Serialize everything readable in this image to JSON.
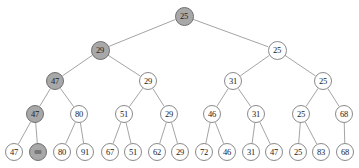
{
  "figure": {
    "name": "binary-tournament-tree",
    "background_color": "#ffffff",
    "node_fill_default": "#ffffff",
    "node_fill_highlight": "#a8a8a8",
    "node_stroke": "#8a8a8a",
    "edge_color": "#9a9a9a",
    "text_color": "#1a1a1a"
  },
  "nodes": [
    {
      "id": "n0",
      "label": "25",
      "level": 0,
      "x": 184,
      "y": 16,
      "r": 9.5,
      "highlighted": true,
      "legible": true
    },
    {
      "id": "n1",
      "label": "29",
      "level": 1,
      "x": 100,
      "y": 50,
      "r": 9.5,
      "highlighted": true,
      "legible": true
    },
    {
      "id": "n2",
      "label": "25",
      "level": 1,
      "x": 277,
      "y": 50,
      "r": 9.5,
      "highlighted": false,
      "legible": true
    },
    {
      "id": "n3",
      "label": "47",
      "level": 2,
      "x": 55,
      "y": 81,
      "r": 9,
      "highlighted": true,
      "legible": true
    },
    {
      "id": "n4",
      "label": "29",
      "level": 2,
      "x": 148,
      "y": 81,
      "r": 9,
      "highlighted": false,
      "legible": true
    },
    {
      "id": "n5",
      "label": "31",
      "level": 2,
      "x": 233,
      "y": 81,
      "r": 9,
      "highlighted": false,
      "legible": true
    },
    {
      "id": "n6",
      "label": "25",
      "level": 2,
      "x": 323,
      "y": 81,
      "r": 9,
      "highlighted": false,
      "legible": true
    },
    {
      "id": "n7",
      "label": "47",
      "level": 3,
      "x": 35,
      "y": 114,
      "r": 9,
      "highlighted": true,
      "legible": true
    },
    {
      "id": "n8",
      "label": "80",
      "level": 3,
      "x": 79,
      "y": 114,
      "r": 9,
      "highlighted": false,
      "legible": true
    },
    {
      "id": "n9",
      "label": "51",
      "level": 3,
      "x": 124,
      "y": 114,
      "r": 9,
      "highlighted": false,
      "legible": true
    },
    {
      "id": "n10",
      "label": "29",
      "level": 3,
      "x": 169,
      "y": 114,
      "r": 9,
      "highlighted": false,
      "legible": true
    },
    {
      "id": "n11",
      "label": "46",
      "level": 3,
      "x": 212,
      "y": 114,
      "r": 9,
      "highlighted": false,
      "legible": true
    },
    {
      "id": "n12",
      "label": "31",
      "level": 3,
      "x": 256,
      "y": 114,
      "r": 9,
      "highlighted": false,
      "legible": true
    },
    {
      "id": "n13",
      "label": "25",
      "level": 3,
      "x": 301,
      "y": 114,
      "r": 9,
      "highlighted": false,
      "legible": true
    },
    {
      "id": "n14",
      "label": "68",
      "level": 3,
      "x": 344,
      "y": 114,
      "r": 9,
      "highlighted": false,
      "legible": true
    },
    {
      "id": "n15",
      "label": "47",
      "level": 4,
      "x": 14,
      "y": 152,
      "r": 9,
      "highlighted": false,
      "legible": true
    },
    {
      "id": "n16",
      "label": "",
      "level": 4,
      "x": 38,
      "y": 152,
      "r": 9,
      "highlighted": true,
      "legible": false
    },
    {
      "id": "n17",
      "label": "80",
      "level": 4,
      "x": 62,
      "y": 152,
      "r": 9,
      "highlighted": false,
      "legible": true
    },
    {
      "id": "n18",
      "label": "91",
      "level": 4,
      "x": 85,
      "y": 152,
      "r": 9,
      "highlighted": false,
      "legible": true
    },
    {
      "id": "n19",
      "label": "67",
      "level": 4,
      "x": 110,
      "y": 152,
      "r": 9,
      "highlighted": false,
      "legible": true
    },
    {
      "id": "n20",
      "label": "51",
      "level": 4,
      "x": 133,
      "y": 152,
      "r": 9,
      "highlighted": false,
      "legible": true
    },
    {
      "id": "n21",
      "label": "62",
      "level": 4,
      "x": 157,
      "y": 152,
      "r": 9,
      "highlighted": false,
      "legible": true
    },
    {
      "id": "n22",
      "label": "29",
      "level": 4,
      "x": 180,
      "y": 152,
      "r": 9,
      "highlighted": false,
      "legible": true
    },
    {
      "id": "n23",
      "label": "72",
      "level": 4,
      "x": 204,
      "y": 152,
      "r": 9,
      "highlighted": false,
      "legible": true
    },
    {
      "id": "n24",
      "label": "46",
      "level": 4,
      "x": 227,
      "y": 152,
      "r": 9,
      "highlighted": false,
      "legible": true
    },
    {
      "id": "n25",
      "label": "31",
      "level": 4,
      "x": 251,
      "y": 152,
      "r": 9,
      "highlighted": false,
      "legible": true
    },
    {
      "id": "n26",
      "label": "47",
      "level": 4,
      "x": 274,
      "y": 152,
      "r": 9,
      "highlighted": false,
      "legible": true
    },
    {
      "id": "n27",
      "label": "25",
      "level": 4,
      "x": 298,
      "y": 152,
      "r": 9,
      "highlighted": false,
      "legible": true
    },
    {
      "id": "n28",
      "label": "83",
      "level": 4,
      "x": 321,
      "y": 152,
      "r": 9,
      "highlighted": false,
      "legible": true
    },
    {
      "id": "n29",
      "label": "68",
      "level": 4,
      "x": 345,
      "y": 152,
      "r": 9,
      "highlighted": false,
      "legible": true
    }
  ],
  "edges": [
    {
      "from": "n0",
      "to": "n1"
    },
    {
      "from": "n0",
      "to": "n2"
    },
    {
      "from": "n1",
      "to": "n3"
    },
    {
      "from": "n1",
      "to": "n4"
    },
    {
      "from": "n2",
      "to": "n5"
    },
    {
      "from": "n2",
      "to": "n6"
    },
    {
      "from": "n3",
      "to": "n7"
    },
    {
      "from": "n3",
      "to": "n8"
    },
    {
      "from": "n4",
      "to": "n9"
    },
    {
      "from": "n4",
      "to": "n10"
    },
    {
      "from": "n5",
      "to": "n11"
    },
    {
      "from": "n5",
      "to": "n12"
    },
    {
      "from": "n6",
      "to": "n13"
    },
    {
      "from": "n6",
      "to": "n14"
    },
    {
      "from": "n7",
      "to": "n15"
    },
    {
      "from": "n7",
      "to": "n16"
    },
    {
      "from": "n8",
      "to": "n17"
    },
    {
      "from": "n8",
      "to": "n18"
    },
    {
      "from": "n9",
      "to": "n19"
    },
    {
      "from": "n9",
      "to": "n20"
    },
    {
      "from": "n10",
      "to": "n21"
    },
    {
      "from": "n10",
      "to": "n22"
    },
    {
      "from": "n11",
      "to": "n23"
    },
    {
      "from": "n11",
      "to": "n24"
    },
    {
      "from": "n12",
      "to": "n25"
    },
    {
      "from": "n12",
      "to": "n26"
    },
    {
      "from": "n13",
      "to": "n27"
    },
    {
      "from": "n13",
      "to": "n28"
    },
    {
      "from": "n14",
      "to": "n29"
    }
  ]
}
